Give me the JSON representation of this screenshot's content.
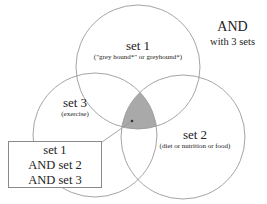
{
  "title": {
    "line1": "AND",
    "line2": "with 3 sets"
  },
  "sets": [
    {
      "name": "set 1",
      "terms": "(\"grey hound*\" or greyhound*)"
    },
    {
      "name": "set 2",
      "terms": "(diet or nutrition or food)"
    },
    {
      "name": "set 3",
      "terms": "(exercise)"
    }
  ],
  "callout": {
    "lines": [
      "set 1",
      "AND set 2",
      "AND set 3"
    ]
  },
  "colors": {
    "circle_stroke": "#9a9a9a",
    "intersection_fill": "#a9a9a9",
    "box_border": "#8a8a8a"
  },
  "diagram": {
    "circles": [
      {
        "set": "set 1",
        "cx": 138,
        "cy": 67,
        "r": 62
      },
      {
        "set": "set 2",
        "cx": 183,
        "cy": 137,
        "r": 62
      },
      {
        "set": "set 3",
        "cx": 95,
        "cy": 135,
        "r": 62
      }
    ],
    "highlighted_region": "set 1 ∩ set 2 ∩ set 3"
  }
}
